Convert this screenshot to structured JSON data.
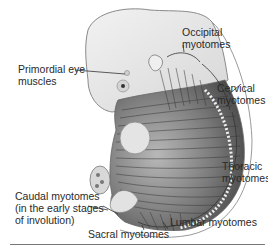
{
  "figure": {
    "labels": {
      "occipital": [
        "Occipital",
        "myotomes"
      ],
      "eye": [
        "Primordial eye",
        "muscles"
      ],
      "cervical": [
        "Cervical",
        "myotomes"
      ],
      "thoracic": [
        "Thoracic",
        "myotomes"
      ],
      "caudal": [
        "Caudal myotomes",
        "(in the early stages",
        "of involution)"
      ],
      "sacral": "Sacral myotomes",
      "lumbar": "Lumbar myotomes"
    },
    "colors": {
      "skin": "#e9e9e9",
      "skin_outline": "#8a8a8a",
      "muscle_dark": "#4a4a4a",
      "muscle_mid": "#8c8c8c",
      "leader_line": "#333333",
      "rule": "#777777"
    }
  }
}
